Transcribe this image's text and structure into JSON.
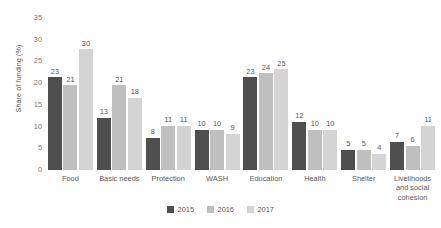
{
  "chart_data": {
    "type": "bar",
    "title": "",
    "xlabel": "",
    "ylabel": "Share of funding (%)",
    "ylim": [
      0,
      35
    ],
    "yticks": [
      35,
      30,
      25,
      20,
      15,
      10,
      5,
      0
    ],
    "grid": false,
    "legend_position": "bottom",
    "categories": [
      "Food",
      "Basic needs",
      "Protection",
      "WASH",
      "Education",
      "Health",
      "Shelter",
      "Livelihoods and social cohesion"
    ],
    "series": [
      {
        "name": "2015",
        "color": "#4f4f4f",
        "values": [
          23,
          13,
          8,
          10,
          23,
          12,
          5,
          7
        ]
      },
      {
        "name": "2016",
        "color": "#bfbfbf",
        "values": [
          21,
          21,
          11,
          10,
          24,
          10,
          5,
          6
        ]
      },
      {
        "name": "2017",
        "color": "#d4d4d4",
        "values": [
          30,
          18,
          11,
          9,
          25,
          10,
          4,
          11
        ]
      }
    ]
  },
  "legend": {
    "items": [
      {
        "label": "2015",
        "color": "#4f4f4f"
      },
      {
        "label": "2016",
        "color": "#bfbfbf"
      },
      {
        "label": "2017",
        "color": "#d4d4d4"
      }
    ]
  },
  "colors": {
    "background": "#ffffff",
    "text": "#595959",
    "tick_text": "#7b7b7b"
  }
}
